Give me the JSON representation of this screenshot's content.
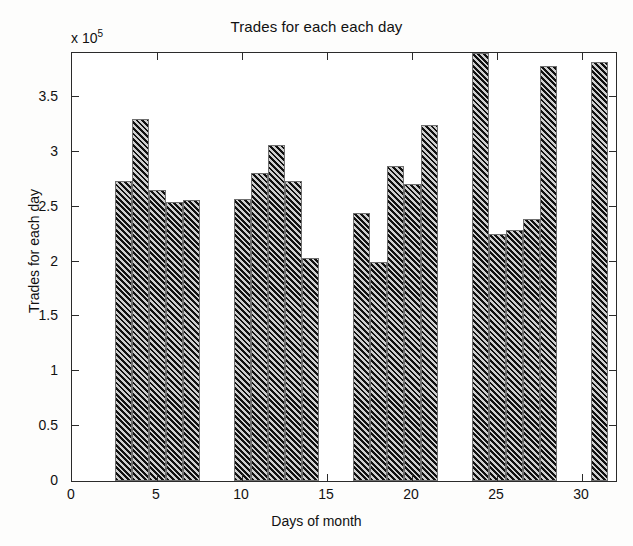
{
  "chart_data": {
    "type": "bar",
    "title": "Trades for each each day",
    "xlabel": "Days of month",
    "ylabel": "Trades for each day",
    "y_multiplier_text": "x 10",
    "y_multiplier_exponent": "5",
    "xlim": [
      0,
      32
    ],
    "ylim": [
      0,
      3.9
    ],
    "ytick_labels": [
      "0",
      "0.5",
      "1",
      "1.5",
      "2",
      "2.5",
      "3",
      "3.5"
    ],
    "ytick_values": [
      0,
      0.5,
      1,
      1.5,
      2,
      2.5,
      3,
      3.5
    ],
    "xtick_labels": [
      "0",
      "5",
      "10",
      "15",
      "20",
      "25",
      "30"
    ],
    "xtick_values": [
      0,
      5,
      10,
      15,
      20,
      25,
      30
    ],
    "grid": false,
    "legend": "none",
    "bar_style": "hatched-diagonal",
    "bar_color": "#3a3a3a",
    "hatch_color": "#111111",
    "axis_color": "#2b2b2b",
    "categories": [
      3,
      4,
      5,
      6,
      7,
      10,
      11,
      12,
      13,
      14,
      17,
      18,
      19,
      20,
      21,
      24,
      25,
      26,
      27,
      28,
      31
    ],
    "values": [
      2.73,
      3.3,
      2.65,
      2.54,
      2.56,
      2.57,
      2.81,
      3.06,
      2.73,
      2.03,
      2.44,
      2.0,
      2.87,
      2.71,
      3.24,
      3.9,
      2.25,
      2.29,
      2.39,
      3.78,
      3.82
    ],
    "bars": [
      {
        "day": 3,
        "value": 2.73
      },
      {
        "day": 4,
        "value": 3.3
      },
      {
        "day": 5,
        "value": 2.65
      },
      {
        "day": 6,
        "value": 2.54
      },
      {
        "day": 7,
        "value": 2.56
      },
      {
        "day": 10,
        "value": 2.57
      },
      {
        "day": 11,
        "value": 2.81
      },
      {
        "day": 12,
        "value": 3.06
      },
      {
        "day": 13,
        "value": 2.73
      },
      {
        "day": 14,
        "value": 2.03
      },
      {
        "day": 17,
        "value": 2.44
      },
      {
        "day": 18,
        "value": 2.0
      },
      {
        "day": 19,
        "value": 2.87
      },
      {
        "day": 20,
        "value": 2.71
      },
      {
        "day": 21,
        "value": 3.24
      },
      {
        "day": 24,
        "value": 3.9
      },
      {
        "day": 25,
        "value": 2.25
      },
      {
        "day": 26,
        "value": 2.29
      },
      {
        "day": 27,
        "value": 2.39
      },
      {
        "day": 28,
        "value": 3.78
      },
      {
        "day": 31,
        "value": 3.82
      }
    ]
  }
}
